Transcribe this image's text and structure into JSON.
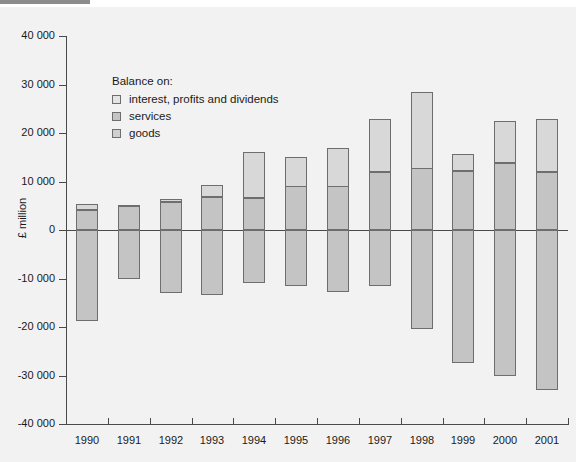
{
  "top_marker": {
    "color": "#8c8c8c"
  },
  "axes": {
    "y_title": "£ million",
    "y_ticks": [
      "40 000",
      "30 000",
      "20 000",
      "10 000",
      "0",
      "-10 000",
      "-20 000",
      "-30 000",
      "-40 000"
    ],
    "y_tick_values": [
      40000,
      30000,
      20000,
      10000,
      0,
      -10000,
      -20000,
      -30000,
      -40000
    ],
    "x_ticks": [
      "1990",
      "1991",
      "1992",
      "1993",
      "1994",
      "1995",
      "1996",
      "1997",
      "1998",
      "1999",
      "2000",
      "2001"
    ]
  },
  "legend": {
    "title": "Balance on:",
    "items": [
      {
        "label": "interest, profits and dividends",
        "color": "#e4e4e4",
        "key": "ipd"
      },
      {
        "label": "services",
        "color": "#c4c4c4",
        "key": "services"
      },
      {
        "label": "goods",
        "color": "#d0d0d0",
        "key": "goods"
      }
    ]
  },
  "colors": {
    "plot_background": "#f2f2f2",
    "page_background": "#ffffff",
    "bar_fill": "#c4c4c4",
    "bar_fill_light": "#d8d8d8",
    "bar_border": "#6e6e6e",
    "axis": "#4a4a4a",
    "text": "#1a1a1a"
  },
  "chart_data": {
    "type": "bar",
    "subtype": "stacked-diverging",
    "title": "",
    "xlabel": "",
    "ylabel": "£ million",
    "ylim": [
      -40000,
      40000
    ],
    "ytick_step": 10000,
    "grid": false,
    "legend_position": "inside-top-left",
    "categories": [
      "1990",
      "1991",
      "1992",
      "1993",
      "1994",
      "1995",
      "1996",
      "1997",
      "1998",
      "1999",
      "2000",
      "2001"
    ],
    "series": [
      {
        "name": "goods",
        "values": [
          -18700,
          -10100,
          -13000,
          -13300,
          -11000,
          -11600,
          -12800,
          -11600,
          -20400,
          -27400,
          -30000,
          -33000
        ]
      },
      {
        "name": "services",
        "values": [
          4100,
          4900,
          5700,
          6900,
          6700,
          9000,
          9000,
          11900,
          12700,
          12100,
          13900,
          12000
        ]
      },
      {
        "name": "interest, profits and dividends",
        "values": [
          1200,
          300,
          700,
          2400,
          9400,
          6100,
          8000,
          11000,
          15800,
          3600,
          8600,
          10900
        ]
      }
    ],
    "stacked_positive_totals": [
      5300,
      5200,
      6400,
      9300,
      16100,
      15100,
      17000,
      22900,
      28500,
      15700,
      22500,
      22900
    ]
  }
}
